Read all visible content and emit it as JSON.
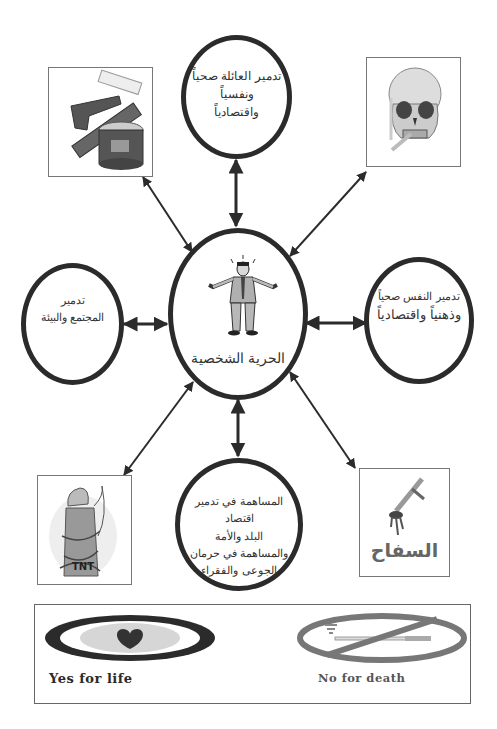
{
  "center": {
    "title": "الحرية الشخصية",
    "icon": "stressed-man-icon"
  },
  "nodes": {
    "top": {
      "lines": [
        "تدمير العائلة صحياً",
        "ونفسياً",
        "واقتصادياً"
      ]
    },
    "left": {
      "lines": [
        "تدمير",
        "المجتمع والبيئة"
      ]
    },
    "right": {
      "lines": [
        "تدمير النفس صحياً",
        "وذهنياً واقتصادياً"
      ]
    },
    "bottom": {
      "lines": [
        "المساهمة في تدمير اقتصاد",
        "البلد والأمة",
        "والمساهمة في حرمان",
        "الجوعى والفقراء"
      ]
    }
  },
  "images": {
    "top_left": {
      "icon": "tobacco-products-icon"
    },
    "top_right": {
      "icon": "smoking-skull-icon"
    },
    "bottom_left": {
      "icon": "tnt-barrel-smoker-icon"
    },
    "bottom_right": {
      "icon": "bloody-dagger-icon",
      "caption": "السفاح"
    }
  },
  "banner": {
    "left": {
      "icon": "heart-oval-icon",
      "label": "Yes for life"
    },
    "right": {
      "icon": "no-smoking-icon",
      "label": "No for death"
    }
  },
  "colors": {
    "stroke": "#2b2b2b",
    "box_border": "#777777",
    "background": "#ffffff"
  }
}
